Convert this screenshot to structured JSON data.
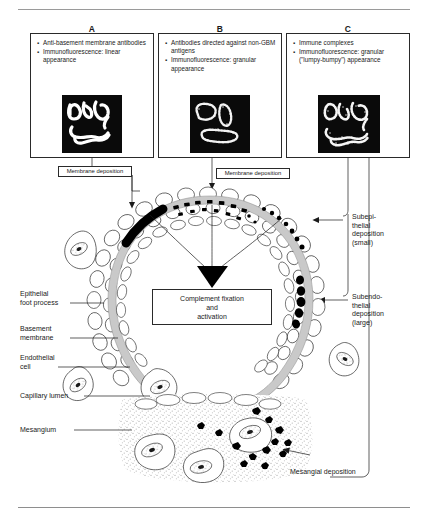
{
  "figure": {
    "title_rule_top": "",
    "title_rule_bottom": ""
  },
  "panels": [
    {
      "letter": "A",
      "bullets": [
        "Anti-basement membrane antibodies",
        "Immunofluorescence: linear appearance"
      ],
      "image_name": "immunofluorescence-linear",
      "image_caption": "linear appearance",
      "deposit_label": "Membrane deposition"
    },
    {
      "letter": "B",
      "bullets": [
        "Antibodies directed against non-GBM antigens",
        "Immunofluorescence: granular appearance"
      ],
      "image_name": "immunofluorescence-granular",
      "image_caption": "granular appearance",
      "deposit_label": "Membrane deposition"
    },
    {
      "letter": "C",
      "bullets": [
        "Immune complexes",
        "Immunofluorescence: granular (\"lumpy-bumpy\") appearance"
      ],
      "image_name": "immunofluorescence-lumpy-bumpy",
      "image_caption": "granular (\"lumpy-bumpy\") appearance",
      "deposit_labels": [
        "Subepi-\nthelial\ndeposition\n(small)",
        "Subendo-\nthelial\ndeposition\n(large)",
        "Mesangial deposition"
      ]
    }
  ],
  "deposit_labels": {
    "membrane_left": "Membrane deposition",
    "membrane_right": "Membrane deposition",
    "subepithelial": "Subepi-\nthelial\ndeposition\n(small)",
    "subepithelial_lines": [
      "Subepi-",
      "thelial",
      "deposition",
      "(small)"
    ],
    "subendothelial_lines": [
      "Subendo-",
      "thelial",
      "deposition",
      "(large)"
    ],
    "mesangial": "Mesangial deposition"
  },
  "center_box": {
    "lines": [
      "Complement fixation",
      "and",
      "activation"
    ],
    "text": "Complement fixation and activation"
  },
  "anatomy_labels": [
    {
      "id": "epithelial-foot-process",
      "lines": [
        "Epithelial",
        "foot process"
      ]
    },
    {
      "id": "basement-membrane",
      "lines": [
        "Basement",
        "membrane"
      ]
    },
    {
      "id": "endothelial-cell",
      "lines": [
        "Endothelial",
        "cell"
      ]
    },
    {
      "id": "capillary-lumen",
      "lines": [
        "Capillary lumen"
      ]
    },
    {
      "id": "mesangium",
      "lines": [
        "Mesangium"
      ]
    }
  ],
  "colors": {
    "ink": "#1a1a1a",
    "rule": "#9a9a9a",
    "gbm_fill": "#c9c9c9",
    "deposit_black": "#000000",
    "fluorescence_bg": "#0a0a0a",
    "fluorescence_fg": "#ffffff",
    "mesangium_stipple": "#b8b8b8"
  }
}
